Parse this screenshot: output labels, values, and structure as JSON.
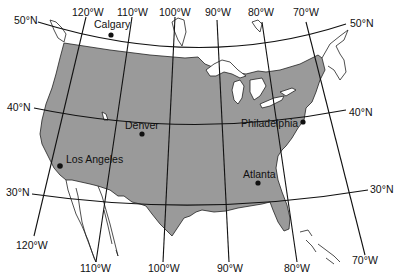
{
  "map": {
    "type": "projection-grid-map",
    "region": "United States (contiguous)",
    "colors": {
      "land": "#9a9a9a",
      "water_and_other": "#ffffff",
      "lines": "#111111"
    },
    "parallels": [
      {
        "label_left": "50°N",
        "label_right": "50°N"
      },
      {
        "label_left": "40°N",
        "label_right": "40°N"
      },
      {
        "label_left": "30°N",
        "label_right": "30°N"
      }
    ],
    "meridians_top": [
      "120°W",
      "110°W",
      "100°W",
      "90°W",
      "80°W",
      "70°W"
    ],
    "meridians_bottom": [
      "120°W",
      "110°W",
      "100°W",
      "90°W",
      "80°W",
      "70°W"
    ],
    "cities": [
      {
        "name": "Calgary"
      },
      {
        "name": "Denver"
      },
      {
        "name": "Philadelphia"
      },
      {
        "name": "Los Angeles"
      },
      {
        "name": "Atlanta"
      }
    ]
  }
}
